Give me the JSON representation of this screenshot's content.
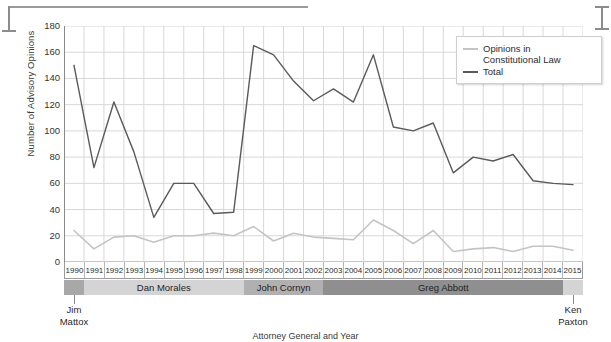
{
  "chart_data": {
    "type": "line",
    "title": "",
    "xlabel": "Attorney General and Year",
    "ylabel": "Number of Advisory Opinions",
    "ylim": [
      0,
      180
    ],
    "yticks": [
      0,
      20,
      40,
      60,
      80,
      100,
      120,
      140,
      160,
      180
    ],
    "grid": true,
    "legend_position": "top-right",
    "categories": [
      "1990",
      "1991",
      "1992",
      "1993",
      "1994",
      "1995",
      "1996",
      "1997",
      "1998",
      "1999",
      "2000",
      "2001",
      "2002",
      "2003",
      "2004",
      "2005",
      "2006",
      "2007",
      "2008",
      "2009",
      "2010",
      "2011",
      "2012",
      "2013",
      "2014",
      "2015"
    ],
    "series": [
      {
        "name": "Total",
        "color": "#5a5a5a",
        "values": [
          150,
          72,
          122,
          84,
          34,
          60,
          60,
          37,
          38,
          165,
          158,
          138,
          123,
          132,
          122,
          158,
          103,
          100,
          106,
          68,
          80,
          77,
          82,
          62,
          60,
          59
        ]
      },
      {
        "name": "Opinions in Constitutional Law",
        "color": "#c4c4c4",
        "values": [
          24,
          10,
          19,
          20,
          15,
          20,
          20,
          22,
          20,
          27,
          16,
          22,
          19,
          18,
          17,
          32,
          24,
          14,
          24,
          8,
          10,
          11,
          8,
          12,
          12,
          9
        ]
      }
    ],
    "attorneys_general": [
      {
        "name": "Jim Mattox",
        "start": "1990",
        "end": "1990",
        "span": 1,
        "color": "#a8a8a8",
        "label_inside": false
      },
      {
        "name": "Dan Morales",
        "start": "1991",
        "end": "1998",
        "span": 8,
        "color": "#d4d4d4",
        "label_inside": true
      },
      {
        "name": "John Cornyn",
        "start": "1999",
        "end": "2002",
        "span": 4,
        "color": "#b0b0b0",
        "label_inside": true
      },
      {
        "name": "Greg Abbott",
        "start": "2003",
        "end": "2014",
        "span": 12,
        "color": "#8f8f8f",
        "label_inside": true
      },
      {
        "name": "Ken Paxton",
        "start": "2015",
        "end": "2015",
        "span": 1,
        "color": "#d4d4d4",
        "label_inside": false
      }
    ],
    "outside_labels": [
      {
        "name": "Jim Mattox",
        "line1": "Jim",
        "line2": "Mattox"
      },
      {
        "name": "Ken Paxton",
        "line1": "Ken",
        "line2": "Paxton"
      }
    ]
  },
  "legend": {
    "items": [
      {
        "label_line1": "Opinions in",
        "label_line2": "Constitutional Law",
        "color": "#c4c4c4"
      },
      {
        "label_line1": "Total",
        "label_line2": "",
        "color": "#5a5a5a"
      }
    ]
  },
  "colors": {
    "grid": "#d8d8d8",
    "axis": "#8a8a8a",
    "total_line": "#5a5a5a",
    "constitutional_line": "#c4c4c4",
    "background": "#ffffff"
  }
}
